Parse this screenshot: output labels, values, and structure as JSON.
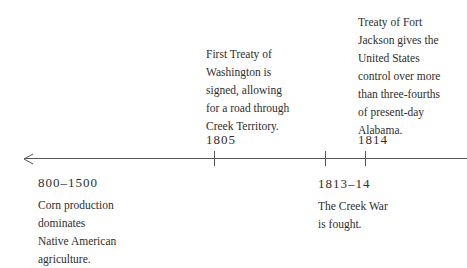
{
  "timeline": {
    "axis": {
      "direction": "left-arrow",
      "color": "#555555"
    },
    "events_above": [
      {
        "year": "1805",
        "lines": [
          "First Treaty of",
          "Washington is",
          "signed, allowing",
          "for a road through",
          "Creek Territory."
        ]
      },
      {
        "year": "1814",
        "lines": [
          "Treaty of Fort",
          "Jackson gives the",
          "United States",
          "control over more",
          "than three-fourths",
          "of present-day",
          "Alabama."
        ]
      }
    ],
    "events_below": [
      {
        "year": "800–1500",
        "lines": [
          "Corn production",
          "dominates",
          "Native American",
          "agriculture."
        ]
      },
      {
        "year": "1813–14",
        "lines": [
          "The Creek War",
          "is fought."
        ]
      }
    ]
  }
}
